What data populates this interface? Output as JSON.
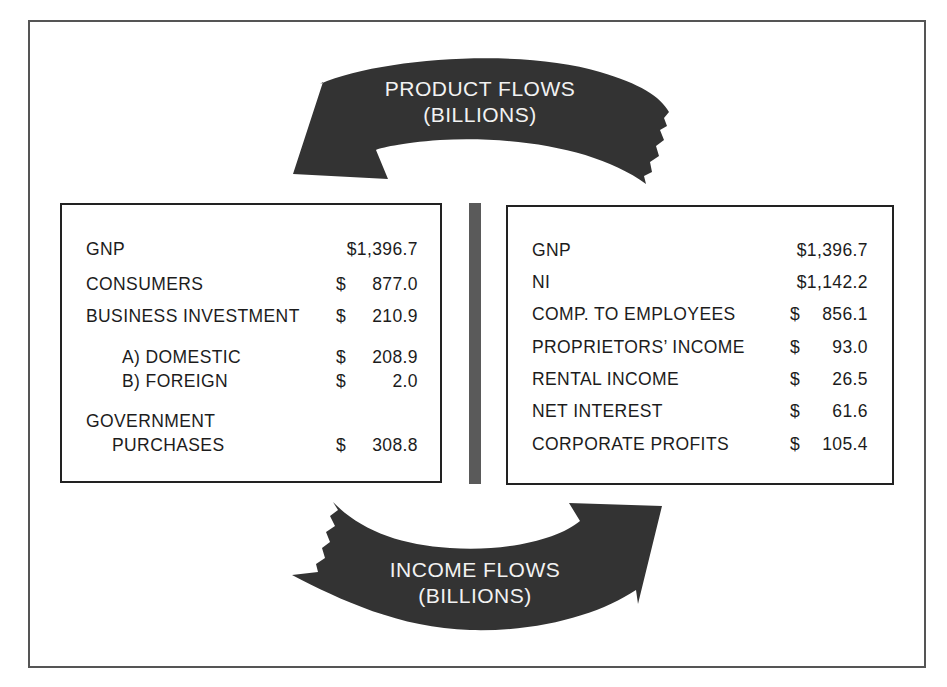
{
  "product_flows": {
    "title": "PRODUCT FLOWS",
    "unit": "(BILLIONS)",
    "direction": "right-to-left",
    "color": "#333333"
  },
  "income_flows": {
    "title": "INCOME FLOWS",
    "unit": "(BILLIONS)",
    "direction": "left-to-right",
    "color": "#333333"
  },
  "left_panel": {
    "rows": [
      {
        "label": "GNP",
        "currency": "",
        "amount": "$1,396.7"
      },
      {
        "label": "CONSUMERS",
        "currency": "$",
        "amount": "877.0"
      },
      {
        "label": "BUSINESS INVESTMENT",
        "currency": "$",
        "amount": "210.9"
      },
      {
        "label": "A) DOMESTIC",
        "currency": "$",
        "amount": "208.9"
      },
      {
        "label": "B) FOREIGN",
        "currency": "$",
        "amount": "2.0"
      },
      {
        "label": "GOVERNMENT",
        "currency": "",
        "amount": ""
      },
      {
        "label": "PURCHASES",
        "currency": "$",
        "amount": "308.8"
      }
    ]
  },
  "right_panel": {
    "rows": [
      {
        "label": "GNP",
        "currency": "",
        "amount": "$1,396.7"
      },
      {
        "label": "NI",
        "currency": "",
        "amount": "$1,142.2"
      },
      {
        "label": "COMP. TO EMPLOYEES",
        "currency": "$",
        "amount": "856.1"
      },
      {
        "label": "PROPRIETORS’ INCOME",
        "currency": "$",
        "amount": "93.0"
      },
      {
        "label": "RENTAL INCOME",
        "currency": "$",
        "amount": "26.5"
      },
      {
        "label": "NET INTEREST",
        "currency": "$",
        "amount": "61.6"
      },
      {
        "label": "CORPORATE PROFITS",
        "currency": "$",
        "amount": "105.4"
      }
    ]
  }
}
